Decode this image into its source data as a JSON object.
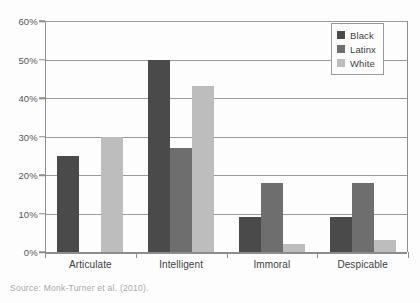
{
  "source_note": "Source: Monk-Turner et al. (2010).",
  "legend": {
    "position": "top-right",
    "items": [
      {
        "label": "Black",
        "color": "#4a4a4a"
      },
      {
        "label": "Latinx",
        "color": "#6e6e6e"
      },
      {
        "label": "White",
        "color": "#bdbdbd"
      }
    ]
  },
  "axis": {
    "y_ticks": [
      "0%",
      "10%",
      "20%",
      "30%",
      "40%",
      "50%",
      "60%"
    ],
    "x_categories": [
      "Articulate",
      "Intelligent",
      "Immoral",
      "Despicable"
    ]
  },
  "chart_data": {
    "type": "bar",
    "title": "",
    "xlabel": "",
    "ylabel": "",
    "ylim": [
      0,
      60
    ],
    "ytick_values": [
      0,
      10,
      20,
      30,
      40,
      50,
      60
    ],
    "grid": true,
    "legend_position": "top-right",
    "categories": [
      "Articulate",
      "Intelligent",
      "Immoral",
      "Despicable"
    ],
    "series": [
      {
        "name": "Black",
        "color": "#4a4a4a",
        "values": [
          25,
          50,
          9,
          9
        ]
      },
      {
        "name": "Latinx",
        "color": "#6e6e6e",
        "values": [
          0,
          27,
          18,
          18
        ]
      },
      {
        "name": "White",
        "color": "#bdbdbd",
        "values": [
          29.8,
          43,
          2,
          3
        ]
      }
    ]
  }
}
